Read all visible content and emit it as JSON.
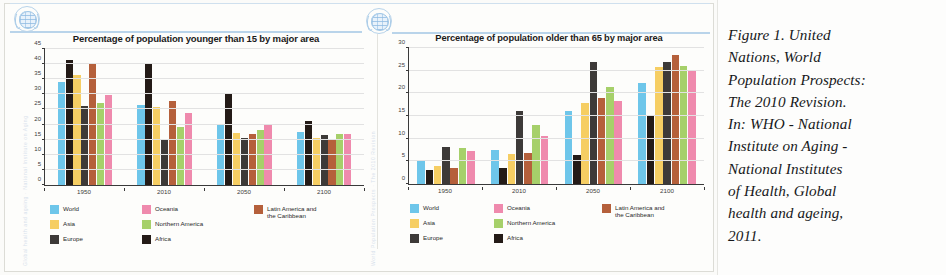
{
  "document": {
    "caption_lines": [
      "Figure 1.   United",
      "Nations, World",
      "Population Prospects:",
      "The 2010 Revision.",
      "In: WHO - National",
      "Institute on Aging -",
      "National Institutes",
      "of Health, Global",
      "health and ageing,",
      "2011."
    ],
    "caption_full": "Figure 1. United Nations, World Population Prospects: The 2010 Revision. In: WHO - National Institute on Aging - National Institutes of Health, Global health and ageing, 2011.",
    "emblem_name": "united-nations-emblem"
  },
  "colors": {
    "world": "#6ec6ea",
    "asia": "#f6ce63",
    "europe": "#3d3a38",
    "oceania": "#ef8aad",
    "northern_america": "#a6d06a",
    "africa": "#241b17",
    "latin_america": "#b5603b",
    "axis": "#3a3a3a",
    "grid": "#e2e2e2"
  },
  "chart_data": [
    {
      "type": "bar",
      "id": "younger-than-15",
      "title": "Percentage of population younger than 15 by major area",
      "xlabel": "",
      "ylabel": "",
      "ylim": [
        0,
        45
      ],
      "yticks": [
        0,
        5,
        10,
        15,
        20,
        25,
        30,
        35,
        40,
        45
      ],
      "grid": true,
      "legend_position": "bottom",
      "categories": [
        "1950",
        "2010",
        "2050",
        "2100"
      ],
      "series": [
        {
          "name": "World",
          "color": "#6ec6ea",
          "values": [
            34.0,
            26.5,
            20.2,
            17.5
          ]
        },
        {
          "name": "Africa",
          "color": "#241b17",
          "values": [
            41.4,
            40.1,
            30.3,
            21.2
          ]
        },
        {
          "name": "Asia",
          "color": "#f6ce63",
          "values": [
            36.5,
            25.7,
            17.2,
            15.5
          ]
        },
        {
          "name": "Europe",
          "color": "#3d3a38",
          "values": [
            26.1,
            15.3,
            15.6,
            16.4
          ]
        },
        {
          "name": "Latin America and the Caribbean",
          "color": "#b5603b",
          "values": [
            40.0,
            27.7,
            16.8,
            15.2
          ]
        },
        {
          "name": "Northern America",
          "color": "#a6d06a",
          "values": [
            27.0,
            19.3,
            18.1,
            16.9
          ]
        },
        {
          "name": "Oceania",
          "color": "#ef8aad",
          "values": [
            29.9,
            23.9,
            20.2,
            16.8
          ]
        }
      ]
    },
    {
      "type": "bar",
      "id": "older-than-65",
      "title": "Percentage of population older than 65 by major area",
      "xlabel": "",
      "ylabel": "",
      "ylim": [
        0,
        30
      ],
      "yticks": [
        0,
        5,
        10,
        15,
        20,
        25,
        30
      ],
      "grid": true,
      "legend_position": "bottom",
      "categories": [
        "1950",
        "2010",
        "2050",
        "2100"
      ],
      "series": [
        {
          "name": "World",
          "color": "#6ec6ea",
          "values": [
            5.0,
            7.4,
            16.1,
            22.3
          ]
        },
        {
          "name": "Africa",
          "color": "#241b17",
          "values": [
            3.2,
            3.5,
            6.5,
            15.0
          ]
        },
        {
          "name": "Asia",
          "color": "#f6ce63",
          "values": [
            4.0,
            6.6,
            17.8,
            25.8
          ]
        },
        {
          "name": "Europe",
          "color": "#3d3a38",
          "values": [
            8.1,
            16.2,
            26.9,
            27.0
          ]
        },
        {
          "name": "Latin America and the Caribbean",
          "color": "#b5603b",
          "values": [
            3.5,
            6.9,
            19.0,
            28.4
          ]
        },
        {
          "name": "Northern America",
          "color": "#a6d06a",
          "values": [
            8.0,
            13.0,
            21.5,
            26.0
          ]
        },
        {
          "name": "Oceania",
          "color": "#ef8aad",
          "values": [
            7.3,
            10.6,
            18.3,
            24.9
          ]
        }
      ]
    }
  ],
  "legend_layout": [
    [
      "World",
      "Oceania",
      "Latin America and"
    ],
    [
      "Asia",
      "Northern America",
      "the Caribbean"
    ],
    [
      "Europe",
      "Africa",
      ""
    ]
  ]
}
